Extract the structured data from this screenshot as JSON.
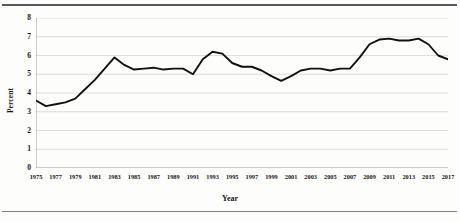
{
  "figure": {
    "ylabel": "Percent",
    "xlabel": "Year",
    "y_ticks": [
      "0",
      "1",
      "2",
      "3",
      "4",
      "5",
      "6",
      "7",
      "8"
    ],
    "line_color": "#111111",
    "gridline_color": "#d4d4d4",
    "axis_color": "#8f8f8f",
    "rule_color": "#555a5e"
  },
  "chart_data": {
    "type": "line",
    "title": "",
    "xlabel": "Year",
    "ylabel": "Percent",
    "xlim": [
      1975,
      2017
    ],
    "ylim": [
      0,
      8
    ],
    "yticks": [
      0,
      1,
      2,
      3,
      4,
      5,
      6,
      7,
      8
    ],
    "xticks": [
      1975,
      1977,
      1979,
      1981,
      1983,
      1985,
      1987,
      1989,
      1991,
      1993,
      1995,
      1997,
      1999,
      2001,
      2003,
      2005,
      2007,
      2009,
      2011,
      2013,
      2015,
      2017
    ],
    "grid": "horizontal",
    "legend": "none",
    "x": [
      1975,
      1976,
      1977,
      1978,
      1979,
      1980,
      1981,
      1982,
      1983,
      1984,
      1985,
      1986,
      1987,
      1988,
      1989,
      1990,
      1991,
      1992,
      1993,
      1994,
      1995,
      1996,
      1997,
      1998,
      1999,
      2000,
      2001,
      2002,
      2003,
      2004,
      2005,
      2006,
      2007,
      2008,
      2009,
      2010,
      2011,
      2012,
      2013,
      2014,
      2015,
      2016,
      2017
    ],
    "values": [
      3.6,
      3.3,
      3.4,
      3.5,
      3.7,
      4.2,
      4.7,
      5.3,
      5.9,
      5.5,
      5.25,
      5.3,
      5.35,
      5.25,
      5.3,
      5.3,
      5.0,
      5.8,
      6.2,
      6.1,
      5.6,
      5.4,
      5.4,
      5.2,
      4.9,
      4.65,
      4.9,
      5.2,
      5.3,
      5.3,
      5.2,
      5.3,
      5.3,
      5.9,
      6.6,
      6.85,
      6.9,
      6.8,
      6.8,
      6.9,
      6.6,
      6.0,
      5.8
    ],
    "series": [
      {
        "name": "Percent",
        "values": [
          3.6,
          3.3,
          3.4,
          3.5,
          3.7,
          4.2,
          4.7,
          5.3,
          5.9,
          5.5,
          5.25,
          5.3,
          5.35,
          5.25,
          5.3,
          5.3,
          5.0,
          5.8,
          6.2,
          6.1,
          5.6,
          5.4,
          5.4,
          5.2,
          4.9,
          4.65,
          4.9,
          5.2,
          5.3,
          5.3,
          5.2,
          5.3,
          5.3,
          5.9,
          6.6,
          6.85,
          6.9,
          6.8,
          6.8,
          6.9,
          6.6,
          6.0,
          5.8
        ]
      }
    ]
  }
}
